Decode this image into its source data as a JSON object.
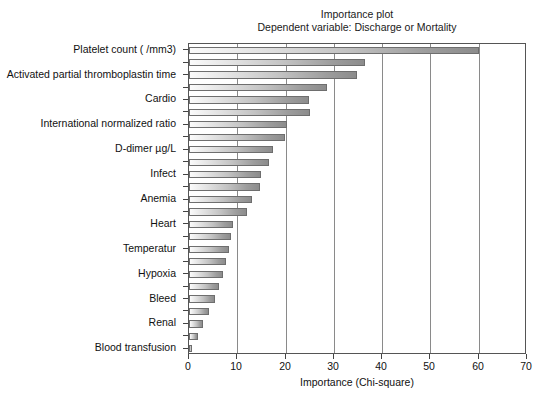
{
  "titles": {
    "main": "Importance plot",
    "sub": "Dependent variable: Discharge or Mortality"
  },
  "axes": {
    "x_title": "Importance (Chi-square)",
    "x_ticks": [
      "0",
      "10",
      "20",
      "30",
      "40",
      "50",
      "60",
      "70"
    ]
  },
  "colors": {
    "bar_fill_light": "#fbfbfb",
    "bar_fill_dark": "#8c8c8c",
    "bar_border": "#6e6e6e",
    "gridline": "#8a8a8a",
    "frame": "#555555",
    "text": "#111111"
  },
  "chart_data": {
    "type": "bar",
    "orientation": "horizontal",
    "title": "Importance plot",
    "subtitle": "Dependent variable: Discharge or Mortality",
    "xlabel": "Importance (Chi-square)",
    "ylabel": "",
    "xlim": [
      0,
      70
    ],
    "xticks": [
      0,
      10,
      20,
      30,
      40,
      50,
      60,
      70
    ],
    "grid": true,
    "legend": false,
    "categories": [
      "Platelet count ( /mm3)",
      "",
      "Activated partial thromboplastin time",
      "",
      "Cardio",
      "",
      "International normalized ratio",
      "",
      "D-dimer µg/L",
      "",
      "Infect",
      "",
      "Anemia",
      "",
      "Heart",
      "",
      "Temperatur",
      "",
      "Hypoxia",
      "",
      "Bleed",
      "",
      "Renal",
      "",
      "Blood transfusion"
    ],
    "visible_tick_labels": [
      "Platelet count ( /mm3)",
      "Activated partial thromboplastin time",
      "Cardio",
      "International normalized ratio",
      "D-dimer µg/L",
      "Infect",
      "Anemia",
      "Heart",
      "Temperatur",
      "Hypoxia",
      "Bleed",
      "Renal",
      "Blood transfusion"
    ],
    "values": [
      60.0,
      36.5,
      34.8,
      28.5,
      24.8,
      25.0,
      20.2,
      19.8,
      17.4,
      16.6,
      15.0,
      14.6,
      13.0,
      12.0,
      9.2,
      8.6,
      8.2,
      7.6,
      7.0,
      6.2,
      5.4,
      4.2,
      3.0,
      1.8,
      0.6
    ]
  }
}
